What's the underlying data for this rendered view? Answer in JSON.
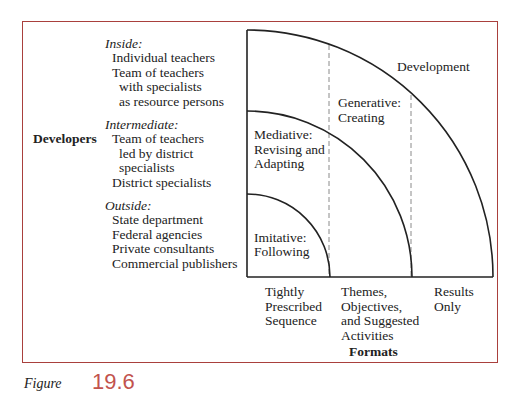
{
  "developers": {
    "axis_label": "Developers",
    "groups": [
      {
        "heading": "Inside:",
        "items": [
          "Individual teachers",
          "Team of teachers",
          "with specialists",
          "as resource persons"
        ]
      },
      {
        "heading": "Intermediate:",
        "items": [
          "Team of teachers",
          "led by district",
          "specialists",
          "District specialists"
        ]
      },
      {
        "heading": "Outside:",
        "items": [
          "State department",
          "Federal agencies",
          "Private consultants",
          "Commercial publishers"
        ]
      }
    ]
  },
  "regions": {
    "imitative": [
      "Imitative:",
      "Following"
    ],
    "mediative": [
      "Mediative:",
      "Revising and",
      "Adapting"
    ],
    "generative": [
      "Generative:",
      "Creating"
    ],
    "development": "Development"
  },
  "formats": {
    "axis_label": "Formats",
    "categories": [
      [
        "Tightly",
        "Prescribed",
        "Sequence"
      ],
      [
        "Themes,",
        "Objectives,",
        "and Suggested",
        "Activities"
      ],
      [
        "Results",
        "Only"
      ]
    ]
  },
  "caption": {
    "prefix": "Figure",
    "number": "19.6"
  },
  "colors": {
    "frame": "#a9403d",
    "lines": "#222222",
    "dashed": "#8a8a8a",
    "caption": "#c2534d"
  }
}
